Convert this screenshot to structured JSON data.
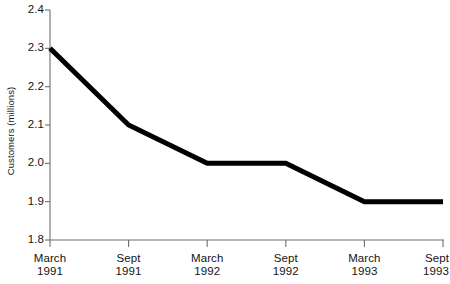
{
  "chart_data": {
    "type": "line",
    "title": "",
    "xlabel": "",
    "ylabel": "Customers (millions)",
    "categories": [
      "March 1991",
      "Sept 1991",
      "March 1992",
      "Sept 1992",
      "March 1993",
      "Sept 1993"
    ],
    "x_tick_labels": [
      {
        "line1": "March",
        "line2": "1991"
      },
      {
        "line1": "Sept",
        "line2": "1991"
      },
      {
        "line1": "March",
        "line2": "1992"
      },
      {
        "line1": "Sept",
        "line2": "1992"
      },
      {
        "line1": "March",
        "line2": "1993"
      },
      {
        "line1": "Sept",
        "line2": "1993"
      }
    ],
    "values": [
      2.3,
      2.1,
      2.0,
      2.0,
      1.9,
      1.9
    ],
    "series": [
      {
        "name": "Customers",
        "values": [
          2.3,
          2.1,
          2.0,
          2.0,
          1.9,
          1.9
        ],
        "color": "#000000"
      }
    ],
    "ylim": [
      1.8,
      2.4
    ],
    "y_tick_values": [
      2.4,
      2.3,
      2.2,
      2.1,
      2.0,
      1.9,
      1.8
    ],
    "y_tick_labels": [
      "2.4",
      "2.3",
      "2.2",
      "2.1",
      "2.0",
      "1.9",
      "1.8"
    ],
    "grid": false,
    "legend": false,
    "legend_position": "none",
    "axis_color": "#6e6e6e",
    "line_color": "#000000",
    "background_color": "#ffffff"
  }
}
